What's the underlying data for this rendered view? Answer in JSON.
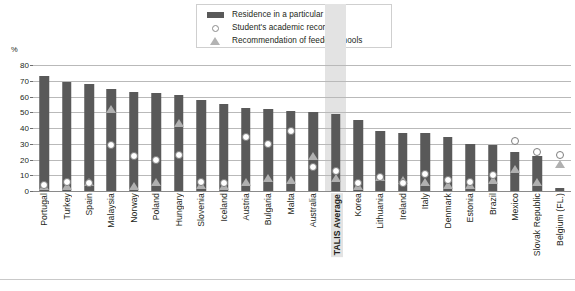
{
  "axis": {
    "unit_label": "%",
    "yticks": [
      0,
      10,
      20,
      30,
      40,
      50,
      60,
      70,
      80
    ]
  },
  "legend": {
    "items": [
      {
        "label": "Residence in a particular area",
        "marker": "bar-swatch",
        "color": "#595959"
      },
      {
        "label": "Student's academic record",
        "marker": "circle-open",
        "color": "#ffffff"
      },
      {
        "label": "Recommendation of feeder schools",
        "marker": "triangle-filled",
        "color": "#b0b0b0"
      }
    ]
  },
  "highlight": {
    "category": "TALIS Average",
    "color": "#e3e3e3"
  },
  "chart_data": {
    "type": "bar",
    "title": "",
    "xlabel": "",
    "ylabel": "%",
    "ylim": [
      0,
      80
    ],
    "grid": true,
    "legend_position": "top-center",
    "categories": [
      "Portugal",
      "Turkey",
      "Spain",
      "Malaysia",
      "Norway",
      "Poland",
      "Hungary",
      "Slovenia",
      "Iceland",
      "Austria",
      "Bulgaria",
      "Malta",
      "Australia",
      "TALIS Average",
      "Korea",
      "Lithuania",
      "Ireland",
      "Italy",
      "Denmark",
      "Estonia",
      "Brazil",
      "Mexico",
      "Slovak Republic",
      "Belgium (FL.)"
    ],
    "series": [
      {
        "name": "Residence in a particular area",
        "type": "bar",
        "color": "#595959",
        "values": [
          73,
          69,
          68,
          65,
          63,
          62,
          61,
          58,
          55,
          53,
          52,
          51,
          50,
          49,
          45,
          38,
          37,
          37,
          34,
          30,
          29,
          25,
          22,
          2
        ]
      },
      {
        "name": "Student's academic record",
        "type": "marker-circle",
        "color": "#ffffff",
        "values": [
          4,
          6,
          5,
          29,
          22,
          20,
          23,
          6,
          5,
          34,
          30,
          38,
          15,
          13,
          5,
          9,
          5,
          11,
          7,
          6,
          10,
          32,
          25,
          23
        ]
      },
      {
        "name": "Recommendation of feeder schools",
        "type": "marker-triangle",
        "color": "#b0b0b0",
        "values": [
          3,
          3,
          6,
          52,
          3,
          6,
          43,
          4,
          3,
          6,
          8,
          7,
          22,
          8,
          3,
          9,
          7,
          6,
          4,
          4,
          7,
          14,
          6,
          17
        ]
      }
    ]
  }
}
